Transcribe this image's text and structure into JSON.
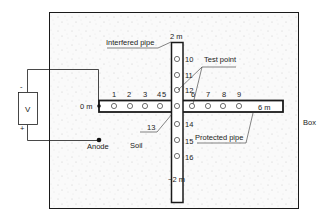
{
  "diagram": {
    "labels": {
      "interfered_pipe": "Interfered pipe",
      "test_point": "Test point",
      "protected_pipe": "Protected pipe",
      "box": "Box",
      "soil": "Soil",
      "anode": "Anode",
      "voltmeter": "V",
      "minus": "-",
      "plus": "+"
    },
    "distances": {
      "protected_start": "0 m",
      "protected_end": "6 m",
      "interfered_top": "2 m",
      "interfered_bottom": "−2 m"
    },
    "test_points_horizontal": [
      "1",
      "2",
      "3",
      "4",
      "5",
      "6",
      "7",
      "8",
      "9"
    ],
    "test_points_vertical": [
      "10",
      "11",
      "12",
      "13",
      "14",
      "15",
      "16"
    ],
    "colors": {
      "line": "#1a1a1a",
      "soil_background": "#f7f7f7",
      "speckle": "#c8c8c8"
    }
  }
}
